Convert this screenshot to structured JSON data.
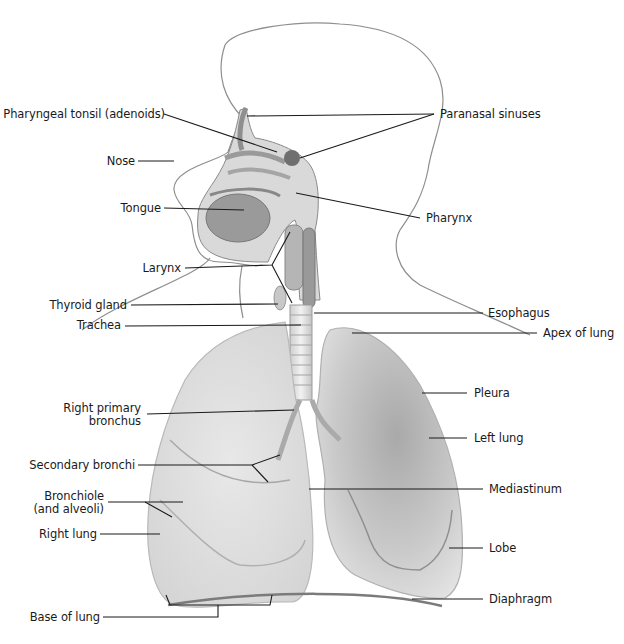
{
  "diagram": {
    "colors": {
      "line": "#1a1a1a",
      "outline": "#8a8a8a",
      "lung_fill": "#dcdcdc",
      "lung_dark": "#a8a8a8",
      "diaphragm": "#7a7a7a"
    },
    "labels_left": [
      {
        "id": "pharyngeal-tonsil",
        "text": "Pharyngeal tonsil (adenoids)"
      },
      {
        "id": "nose",
        "text": "Nose"
      },
      {
        "id": "tongue",
        "text": "Tongue"
      },
      {
        "id": "larynx",
        "text": "Larynx"
      },
      {
        "id": "thyroid-gland",
        "text": "Thyroid gland"
      },
      {
        "id": "trachea",
        "text": "Trachea"
      },
      {
        "id": "right-primary-bronchus-1",
        "text": "Right primary"
      },
      {
        "id": "right-primary-bronchus-2",
        "text": "bronchus"
      },
      {
        "id": "secondary-bronchi",
        "text": "Secondary bronchi"
      },
      {
        "id": "bronchiole-1",
        "text": "Bronchiole"
      },
      {
        "id": "bronchiole-2",
        "text": "(and alveoli)"
      },
      {
        "id": "right-lung",
        "text": "Right lung"
      },
      {
        "id": "base-of-lung",
        "text": "Base of lung"
      }
    ],
    "labels_right": [
      {
        "id": "paranasal-sinuses",
        "text": "Paranasal sinuses"
      },
      {
        "id": "pharynx",
        "text": "Pharynx"
      },
      {
        "id": "esophagus",
        "text": "Esophagus"
      },
      {
        "id": "apex-of-lung",
        "text": "Apex of lung"
      },
      {
        "id": "pleura",
        "text": "Pleura"
      },
      {
        "id": "left-lung",
        "text": "Left lung"
      },
      {
        "id": "mediastinum",
        "text": "Mediastinum"
      },
      {
        "id": "lobe",
        "text": "Lobe"
      },
      {
        "id": "diaphragm",
        "text": "Diaphragm"
      }
    ]
  }
}
